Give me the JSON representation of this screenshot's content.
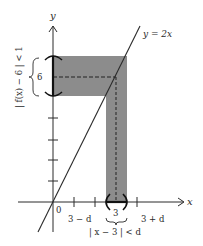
{
  "figure": {
    "axis_labels": {
      "x": "x",
      "y": "y"
    },
    "line_label": "y = 2x",
    "origin_label": "0",
    "y_center_label": "6",
    "x_center_label": "3",
    "x_left_label": "3 − d",
    "x_right_label": "3 + d",
    "x_interval_label": "| x − 3 | < d",
    "y_interval_label": "| f(x) − 6 | < 1",
    "colors": {
      "band": "#8c8c8c",
      "ink": "#2a2a2a",
      "background": "#ffffff"
    }
  }
}
